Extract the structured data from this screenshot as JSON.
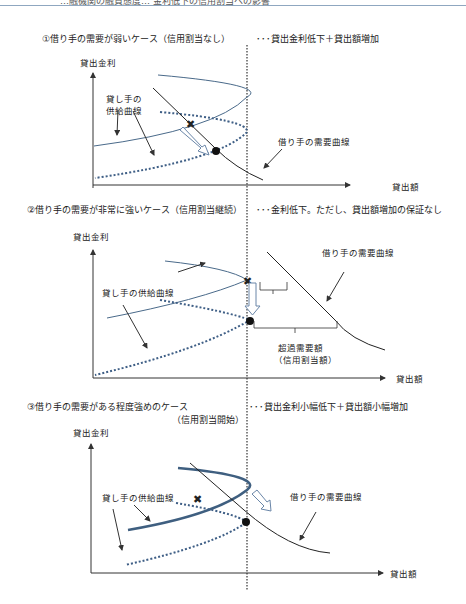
{
  "header": {
    "text": "…融機関の融資態度… 金利低下の信用割当への影響"
  },
  "panels": [
    {
      "title": "①借り手の需要が弱いケース（信用割当なし）",
      "result": "･･･貸出金利低下＋貸出額増加",
      "y_axis": "貸出金利",
      "x_axis": "貸出額",
      "supply_label_line1": "貸し手の",
      "supply_label_line2": "供給曲線",
      "demand_label": "借り手の需要曲線"
    },
    {
      "title": "②借り手の需要が非常に強いケース（信用割当継続）",
      "result": "･･･金利低下。ただし、貸出額増加の保証なし",
      "y_axis": "貸出金利",
      "x_axis": "貸出額",
      "supply_label": "貸し手の供給曲線",
      "demand_label": "借り手の需要曲線",
      "excess_label_line1": "超過需要額",
      "excess_label_line2": "（信用割当額）"
    },
    {
      "title": "③借り手の需要がある程度強めのケース",
      "title_line2": "（信用割当開始）",
      "result": "･･･貸出金利小幅低下＋貸出額小幅増加",
      "y_axis": "貸出金利",
      "x_axis": "貸出額",
      "supply_label": "貸し手の供給曲線",
      "demand_label": "借り手の需要曲線"
    }
  ],
  "colors": {
    "supply": "#4a6a8a",
    "supply_shift": "#3f5f86",
    "demand": "#222222",
    "axis": "#333333"
  }
}
